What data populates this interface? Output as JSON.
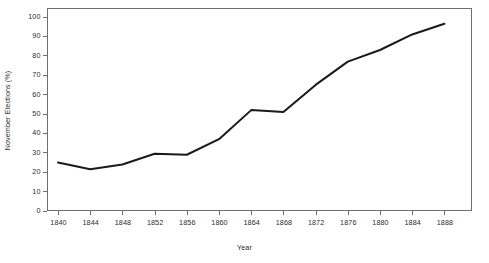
{
  "chart_data": {
    "type": "line",
    "title": "",
    "xlabel": "Year",
    "ylabel": "November Elections (%)",
    "x": [
      1840,
      1844,
      1848,
      1852,
      1856,
      1860,
      1864,
      1868,
      1872,
      1876,
      1880,
      1884,
      1888
    ],
    "values": [
      25,
      21.5,
      24,
      29.5,
      29,
      37,
      52,
      51,
      65,
      77,
      83,
      91,
      96.5
    ],
    "series": [
      {
        "name": "November Elections (%)",
        "values": [
          25,
          21.5,
          24,
          29.5,
          29,
          37,
          52,
          51,
          65,
          77,
          83,
          91,
          96.5
        ]
      }
    ],
    "xlim": [
      1838,
      1890
    ],
    "ylim": [
      0,
      103
    ],
    "x_tick_labels": [
      "1840",
      "1844",
      "1848",
      "1852",
      "1856",
      "1860",
      "1864",
      "1868",
      "1872",
      "1876",
      "1880",
      "1884",
      "1888"
    ],
    "y_tick_labels": [
      "0",
      "10",
      "20",
      "30",
      "40",
      "50",
      "60",
      "70",
      "80",
      "90",
      "100"
    ],
    "y_ticks": [
      0,
      10,
      20,
      30,
      40,
      50,
      60,
      70,
      80,
      90,
      100
    ],
    "grid": false,
    "legend": "none",
    "line_color": "#1a1a1a",
    "line_width": 2,
    "frame_color": "#6e6e6e",
    "background": "#ffffff"
  }
}
